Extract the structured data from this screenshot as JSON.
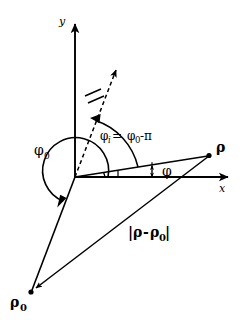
{
  "figure": {
    "background_color": "#ffffff",
    "stroke_color": "#000000",
    "width": 248,
    "height": 328
  },
  "axes": {
    "x_label": "x",
    "y_label": "y",
    "origin": {
      "x": 75,
      "y": 177
    }
  },
  "labels": {
    "phi_zero": "φ",
    "phi_zero_sub": "0",
    "phi_i_lhs": "φ",
    "phi_i_lhs_sub": "i",
    "phi_i_eq": " = ",
    "phi_i_rhs": "φ",
    "phi_i_rhs_sub": "0",
    "phi_i_rhs_tail": "-π",
    "phi": "φ",
    "rho": "ρ",
    "rho_zero": "ρ",
    "rho_zero_sub": "0",
    "distance_open": "|",
    "distance_rho": "ρ",
    "distance_minus": "-",
    "distance_rho0": "ρ",
    "distance_rho0_sub": "0",
    "distance_close": "|"
  },
  "points": {
    "rho": {
      "x": 210,
      "y": 155
    },
    "rho_zero": {
      "x": 31,
      "y": 292
    }
  },
  "vectors": [
    {
      "name": "rho-vector",
      "from": [
        75,
        177
      ],
      "to": [
        210,
        155
      ]
    },
    {
      "name": "rho-zero-vector",
      "from": [
        75,
        177
      ],
      "to": [
        31,
        292
      ]
    },
    {
      "name": "difference-vector",
      "from": [
        210,
        155
      ],
      "to": [
        31,
        292
      ]
    },
    {
      "name": "incident-direction-dashed",
      "from": [
        75,
        177
      ],
      "to": [
        120,
        60
      ]
    }
  ],
  "annotations": {
    "double_hash_on_dashed": true,
    "phi_small_double_arrow": true
  }
}
